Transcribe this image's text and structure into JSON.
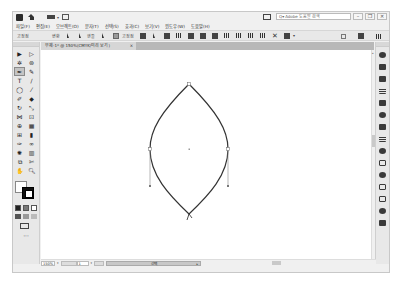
{
  "app": {
    "name": "Adobe Illustrator",
    "titlebar": {
      "logo_icon": "ai-logo-icon",
      "home_icon": "home-icon",
      "workspace_switch_icon": "workspace-switcher-icon",
      "arrange_icon": "arrange-documents-icon",
      "help_search_placeholder": "Adobe 도움말 검색",
      "window_controls": {
        "minimize": "–",
        "restore": "❐",
        "close": "✕"
      }
    },
    "menu": [
      {
        "label": "파일(F)"
      },
      {
        "label": "편집(E)"
      },
      {
        "label": "오브젝트(O)"
      },
      {
        "label": "문자(T)"
      },
      {
        "label": "선택(S)"
      },
      {
        "label": "효과(C)"
      },
      {
        "label": "보기(V)"
      },
      {
        "label": "윈도우(W)"
      },
      {
        "label": "도움말(H)"
      }
    ],
    "control_bar": {
      "anchor_point_label": "고정점",
      "convert_label": "변환",
      "handles_label": "핸들",
      "anchor_points_label": "고정점",
      "icons": [
        "convert-corner-icon",
        "convert-smooth-icon",
        "show-handles-icon",
        "hide-handles-icon",
        "remove-anchor-icon",
        "connect-points-icon",
        "cut-path-icon",
        "isolate-icon",
        "align-left-icon",
        "align-center-icon",
        "align-right-icon",
        "align-top-icon",
        "align-middle-icon",
        "align-bottom-icon",
        "distribute-icon",
        "transform-icon",
        "recolor-icon"
      ]
    },
    "document_tab": {
      "title": "무제-1* @ 150%(CMYK/미리 보기)",
      "close": "×"
    },
    "tools": [
      {
        "name": "selection-tool",
        "glyph": "▶"
      },
      {
        "name": "direct-selection-tool",
        "glyph": "▷"
      },
      {
        "name": "magic-wand-tool",
        "glyph": "✲"
      },
      {
        "name": "lasso-tool",
        "glyph": "⊚"
      },
      {
        "name": "pen-tool",
        "glyph": "✒",
        "active": true
      },
      {
        "name": "curvature-tool",
        "glyph": "✎"
      },
      {
        "name": "type-tool",
        "glyph": "T"
      },
      {
        "name": "line-segment-tool",
        "glyph": "/"
      },
      {
        "name": "ellipse-tool",
        "glyph": "◯"
      },
      {
        "name": "paintbrush-tool",
        "glyph": "⁄"
      },
      {
        "name": "shaper-tool",
        "glyph": "✐"
      },
      {
        "name": "eraser-tool",
        "glyph": "◆"
      },
      {
        "name": "rotate-tool",
        "glyph": "↻"
      },
      {
        "name": "scale-tool",
        "glyph": "⤡"
      },
      {
        "name": "width-tool",
        "glyph": "⋈"
      },
      {
        "name": "free-transform-tool",
        "glyph": "⊡"
      },
      {
        "name": "shape-builder-tool",
        "glyph": "⊕"
      },
      {
        "name": "perspective-grid-tool",
        "glyph": "▦"
      },
      {
        "name": "mesh-tool",
        "glyph": "⊞"
      },
      {
        "name": "gradient-tool",
        "glyph": "▮"
      },
      {
        "name": "eyedropper-tool",
        "glyph": "✑"
      },
      {
        "name": "blend-tool",
        "glyph": "∞"
      },
      {
        "name": "symbol-sprayer-tool",
        "glyph": "✺"
      },
      {
        "name": "column-graph-tool",
        "glyph": "▥"
      },
      {
        "name": "artboard-tool",
        "glyph": "⧉"
      },
      {
        "name": "slice-tool",
        "glyph": "✄"
      },
      {
        "name": "hand-tool",
        "glyph": "✋"
      },
      {
        "name": "zoom-tool",
        "glyph": "🔍︎"
      }
    ],
    "fill_stroke": {
      "fill_color": "#ffffff",
      "stroke_color": "#000000",
      "swap_icon": "↰",
      "default_icon": "◪"
    },
    "more_tools_label": "···",
    "dock_panels": [
      "properties-panel-icon",
      "libraries-panel-icon",
      "color-panel-icon",
      "color-guide-panel-icon",
      "swatches-panel-icon",
      "brushes-panel-icon",
      "symbols-panel-icon",
      "stroke-panel-icon",
      "gradient-panel-icon",
      "transparency-panel-icon",
      "appearance-panel-icon",
      "layers-panel-icon",
      "artboards-panel-icon",
      "asset-export-panel-icon"
    ],
    "status_bar": {
      "zoom": "150%",
      "page": "1",
      "current_tool": "선택"
    },
    "canvas": {
      "shape": "lens-path",
      "stroke_color": "#333333"
    }
  }
}
